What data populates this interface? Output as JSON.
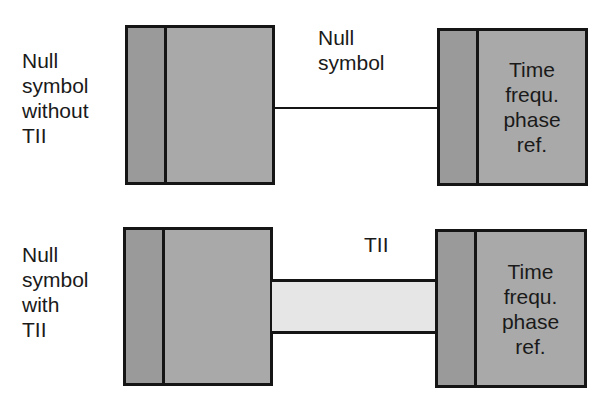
{
  "rows": [
    {
      "side_label": [
        "Null",
        "symbol",
        "without",
        "TII"
      ],
      "connector_label": [
        "Null",
        "symbol"
      ],
      "connector_type": "line",
      "right_box_label": [
        "Time",
        "frequ.",
        "phase",
        "ref."
      ]
    },
    {
      "side_label": [
        "Null",
        "symbol",
        "with",
        "TII"
      ],
      "connector_label": [
        "TII"
      ],
      "connector_type": "band",
      "right_box_label": [
        "Time",
        "frequ.",
        "phase",
        "ref."
      ]
    }
  ],
  "colors": {
    "box_fill": "#a9a9a9",
    "box_strip_fill": "#9a9a9a",
    "band_fill": "#e6e6e6",
    "stroke": "#151515"
  }
}
